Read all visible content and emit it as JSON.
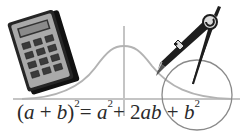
{
  "illustration": {
    "description": "Math clip-art: calculator, bell curve on axes, compass drawing a circle, binomial identity",
    "elements": [
      "calculator-icon",
      "bell-curve",
      "axes",
      "compass-icon",
      "circle"
    ],
    "colors": {
      "background": "#ffffff",
      "curve": "#b3b3b3",
      "axis": "#c4c4c4",
      "circle": "#8a8a8a",
      "calculator_body": "#1a1a1a",
      "calculator_face": "#a9a9a9",
      "calculator_keys": "#3a3a3a",
      "compass": "#1e1e1e",
      "text": "#2a2a2a"
    }
  },
  "formula": {
    "lhs_open": "(",
    "a1": "a",
    "plus1": " + ",
    "b1": "b",
    "lhs_close": ")",
    "lhs_exp": "2",
    "equals": "= ",
    "a2": "a",
    "a2_exp": "2",
    "plus2": "+ 2",
    "ab": "ab",
    "plus3": " + ",
    "b2": "b",
    "b2_exp": "2",
    "full_text": "(a + b)² = a² + 2ab + b²"
  }
}
